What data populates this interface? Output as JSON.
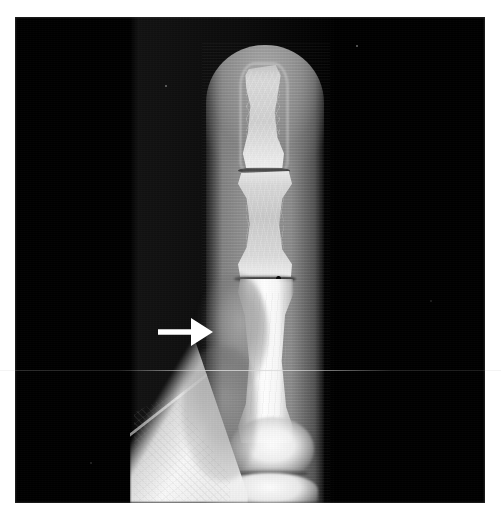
{
  "figure": {
    "modality": "X-ray",
    "body_part": "Finger",
    "view": "Lateral",
    "caption": "Lateral radiograph of a finger showing soft tissue swelling over the proximal phalanx, indicated by the white arrow",
    "width_px": 501,
    "height_px": 519
  },
  "plate": {
    "background_color": "#000000",
    "border_color": "#ffffff",
    "left_px": 15,
    "top_px": 17,
    "width_px": 470,
    "height_px": 486
  },
  "annotation": {
    "arrow": {
      "label": "arrow",
      "direction": "right",
      "color": "#ffffff",
      "x_px": 143,
      "y_px": 297,
      "width_px": 56,
      "height_px": 36,
      "points_to": "soft tissue swelling"
    }
  },
  "anatomy": {
    "regions": [
      {
        "id": "distal-phalanx",
        "label": "Distal phalanx"
      },
      {
        "id": "dip-joint-space",
        "label": "DIP joint space"
      },
      {
        "id": "middle-phalanx",
        "label": "Middle phalanx"
      },
      {
        "id": "pip-joint-space",
        "label": "PIP joint space"
      },
      {
        "id": "proximal-phalanx",
        "label": "Proximal phalanx"
      },
      {
        "id": "soft-tissue-swelling",
        "label": "Soft tissue swelling"
      },
      {
        "id": "mcp-head",
        "label": "Metacarpal head"
      },
      {
        "id": "mcp-joint-space",
        "label": "MCP joint space"
      },
      {
        "id": "metacarpal-base",
        "label": "Metacarpal base"
      },
      {
        "id": "adjacent-digit",
        "label": "Adjacent digit"
      },
      {
        "id": "web-space-shadow",
        "label": "Web space soft tissue"
      },
      {
        "id": "finger-soft-tissue",
        "label": "Finger soft tissue envelope"
      }
    ]
  },
  "artifacts": {
    "scanline": {
      "label": "Horizontal scan line artifact",
      "y_px": 370
    },
    "specks": [
      {
        "x_px": 165,
        "y_px": 85,
        "size_px": 2
      },
      {
        "x_px": 356,
        "y_px": 45,
        "size_px": 2
      },
      {
        "x_px": 90,
        "y_px": 462,
        "size_px": 2
      },
      {
        "x_px": 430,
        "y_px": 300,
        "size_px": 2
      }
    ]
  },
  "palette": {
    "film_black": "#000000",
    "bone_white": "#ffffff",
    "soft_tissue_gray": "#a8a8a8",
    "fog_gray": "#222222",
    "arrow_white": "#ffffff",
    "page_white": "#ffffff"
  }
}
